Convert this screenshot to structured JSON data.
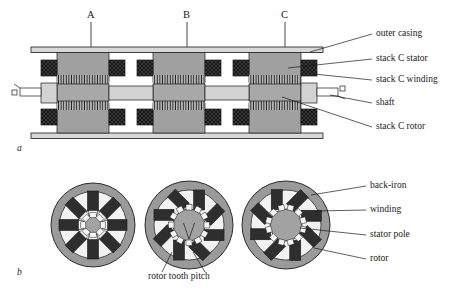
{
  "figure": {
    "subfigure_a_label": "a",
    "subfigure_b_label": "b",
    "stack_labels": [
      "A",
      "B",
      "C"
    ],
    "callouts_a": [
      "outer casing",
      "stack C stator",
      "stack C winding",
      "shaft",
      "stack C rotor"
    ],
    "callouts_b": [
      "back-iron",
      "winding",
      "stator pole",
      "rotor"
    ],
    "callout_b_bottom": "rotor tooth pitch"
  },
  "colors": {
    "line": "#1a1a1a",
    "casing_fill": "#d8d8d8",
    "stator_fill": "#a0a0a0",
    "rotor_fill": "#a8a8a8",
    "shaft_fill": "#d2d2d2",
    "winding_dark": "#3a3a3a",
    "back_iron_fill": "#9a9a9a",
    "pole_fill": "#2e2e2e",
    "slot_fill": "#f2f2f2",
    "background": "#ffffff"
  },
  "geometry": {
    "stack_count": 3,
    "stator_poles_per_stack": 8,
    "rotor_teeth_section_a": 8,
    "rotor_teeth_section_bc": 12
  }
}
